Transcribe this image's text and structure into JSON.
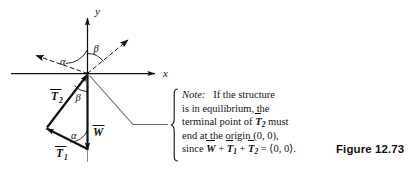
{
  "figure": {
    "caption": "Figure 12.73",
    "axes": {
      "x_label": "x",
      "y_label": "y"
    },
    "angles": [
      {
        "name": "alpha-upper",
        "label": "α"
      },
      {
        "name": "beta-upper",
        "label": "β"
      },
      {
        "name": "beta-lower",
        "label": "β"
      },
      {
        "name": "alpha-lower",
        "label": "α"
      }
    ],
    "vectors": [
      {
        "name": "T2",
        "base": "T",
        "sub": "2"
      },
      {
        "name": "T1",
        "base": "T",
        "sub": "1"
      },
      {
        "name": "W",
        "base": "W",
        "sub": ""
      }
    ],
    "note": {
      "lead": "Note:",
      "line1_rest": "If the structure",
      "line2": "is in equilibrium, the",
      "line3_a": "terminal point of",
      "line3_vec": "T",
      "line3_sub": "2",
      "line3_b": "must",
      "line4": "end at the origin (0, 0),",
      "line5_since": "since",
      "line5_w": "W",
      "line5_plus1": "+",
      "line5_t1": "T",
      "line5_t1sub": "1",
      "line5_plus2": "+",
      "line5_t2": "T",
      "line5_t2sub": "2",
      "line5_eq": "= ⟨0, 0⟩."
    }
  },
  "colors": {
    "ink": "#111111",
    "background": "#ffffff",
    "leader": "#555555"
  }
}
